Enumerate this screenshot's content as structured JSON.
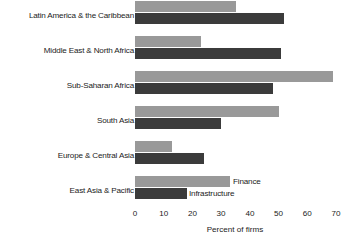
{
  "chart_data": {
    "type": "bar",
    "orientation": "horizontal",
    "title": "",
    "xlabel": "Percent of firms",
    "ylabel": "",
    "xlim": [
      0,
      70
    ],
    "xticks": [
      0,
      10,
      20,
      30,
      40,
      50,
      60,
      70
    ],
    "grid": false,
    "legend_position": "inline-right-of-last-group",
    "categories": [
      "Latin America & the Caribbean",
      "Middle East & North Africa",
      "Sub-Saharan Africa",
      "South Asia",
      "Europe & Central Asia",
      "East Asia & Pacific"
    ],
    "series": [
      {
        "name": "Finance",
        "color": "#999999",
        "values": [
          35,
          23,
          69,
          50,
          13,
          33
        ]
      },
      {
        "name": "Infrastructure",
        "color": "#3b3b3b",
        "values": [
          52,
          51,
          48,
          30,
          24,
          18
        ]
      }
    ]
  },
  "axis": {
    "tick_labels": [
      "0",
      "10",
      "20",
      "30",
      "40",
      "50",
      "60",
      "70"
    ],
    "title": "Percent of firms"
  },
  "annotations": {
    "finance_label": "Finance",
    "infrastructure_label": "Infrastructure"
  }
}
